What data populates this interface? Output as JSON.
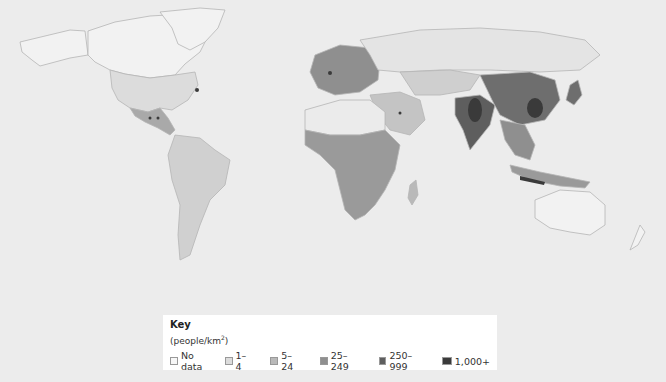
{
  "map": {
    "type": "choropleth world map",
    "subject": "World population density",
    "background_color": "#ececec",
    "land_outline_color": "#b8b8b8"
  },
  "key": {
    "title": "Key",
    "unit_prefix": "(people/km",
    "unit_sup": "2",
    "unit_suffix": ")",
    "items": [
      {
        "label": "No data",
        "color": "#f7f7f7"
      },
      {
        "label": "1–4",
        "color": "#dcdcdc"
      },
      {
        "label": "5–24",
        "color": "#b9b9b9"
      },
      {
        "label": "25–249",
        "color": "#8f8f8f"
      },
      {
        "label": "250–999",
        "color": "#5e5e5e"
      },
      {
        "label": "1,000+",
        "color": "#3a3a3a"
      }
    ]
  }
}
